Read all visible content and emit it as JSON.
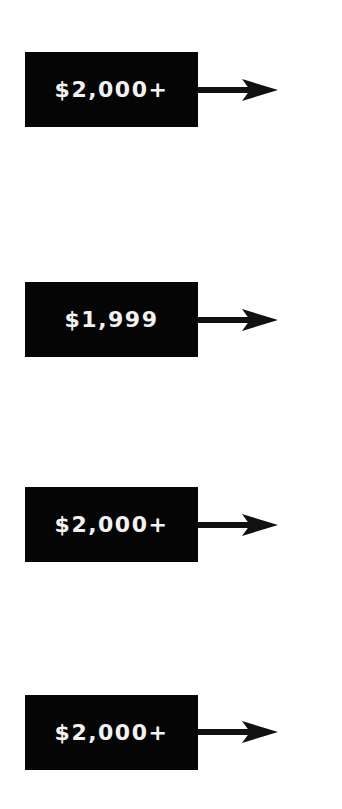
{
  "price_tags": [
    {
      "label": "$2,000+",
      "top": 52,
      "arrow": "right-arrow"
    },
    {
      "label": "$1,999",
      "top": 282,
      "arrow": "right-arrow"
    },
    {
      "label": "$2,000+",
      "top": 487,
      "arrow": "right-arrow"
    },
    {
      "label": "$2,000+",
      "top": 695,
      "arrow": "right-arrow"
    }
  ],
  "colors": {
    "tag_bg": "#050505",
    "tag_text": "#f2f2f2",
    "arrow": "#111111"
  }
}
